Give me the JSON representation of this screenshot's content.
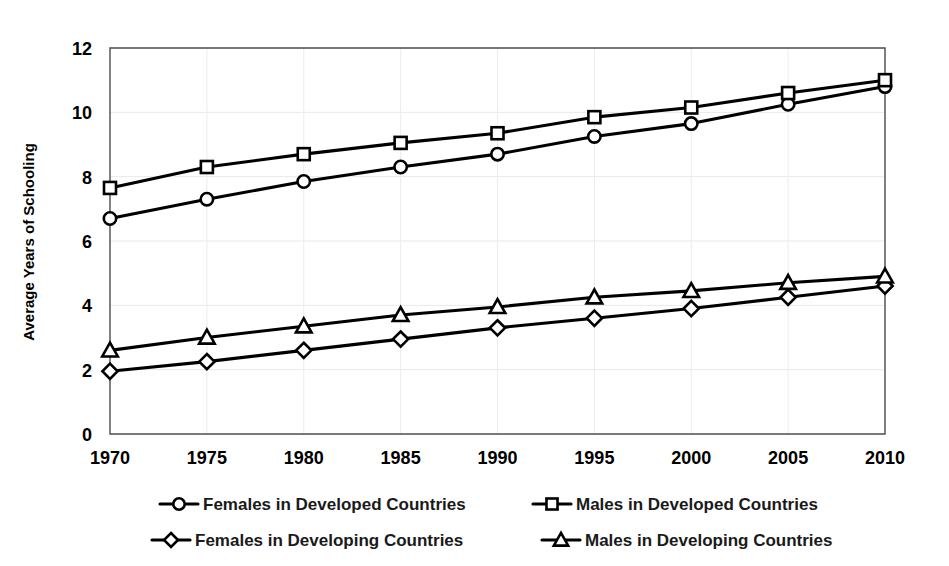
{
  "chart_data": {
    "type": "line",
    "title": "",
    "xlabel": "",
    "ylabel": "Average Years of Schooling",
    "categories": [
      1970,
      1975,
      1980,
      1985,
      1990,
      1995,
      2000,
      2005,
      2010
    ],
    "x_tick_labels": [
      "1970",
      "1975",
      "1980",
      "1985",
      "1990",
      "1995",
      "2000",
      "2005",
      "2010"
    ],
    "y_tick_labels": [
      "0",
      "2",
      "4",
      "6",
      "8",
      "10",
      "12"
    ],
    "y_ticks": [
      0,
      2,
      4,
      6,
      8,
      10,
      12
    ],
    "ylim": [
      0,
      12
    ],
    "xlim": [
      1970,
      2010
    ],
    "grid": "horizontal-and-vertical",
    "legend_position": "bottom",
    "series": [
      {
        "name": "Females in Developed Countries",
        "marker": "circle",
        "color": "#000000",
        "values": [
          6.7,
          7.3,
          7.85,
          8.3,
          8.7,
          9.25,
          9.65,
          10.25,
          10.8
        ]
      },
      {
        "name": "Males in Developed Countries",
        "marker": "square",
        "color": "#000000",
        "values": [
          7.65,
          8.3,
          8.7,
          9.05,
          9.35,
          9.85,
          10.15,
          10.6,
          11.0
        ]
      },
      {
        "name": "Females in Developing Countries",
        "marker": "diamond",
        "color": "#000000",
        "values": [
          1.95,
          2.25,
          2.6,
          2.95,
          3.3,
          3.6,
          3.9,
          4.25,
          4.6
        ]
      },
      {
        "name": "Males in Developing Countries",
        "marker": "triangle",
        "color": "#000000",
        "values": [
          2.6,
          3.0,
          3.35,
          3.7,
          3.95,
          4.25,
          4.45,
          4.7,
          4.9
        ]
      }
    ]
  },
  "legend": {
    "items": [
      {
        "label": "Females in Developed Countries",
        "marker": "circle"
      },
      {
        "label": "Males in Developed Countries",
        "marker": "square"
      },
      {
        "label": "Females in Developing Countries",
        "marker": "diamond"
      },
      {
        "label": "Males in Developing Countries",
        "marker": "triangle"
      }
    ]
  }
}
